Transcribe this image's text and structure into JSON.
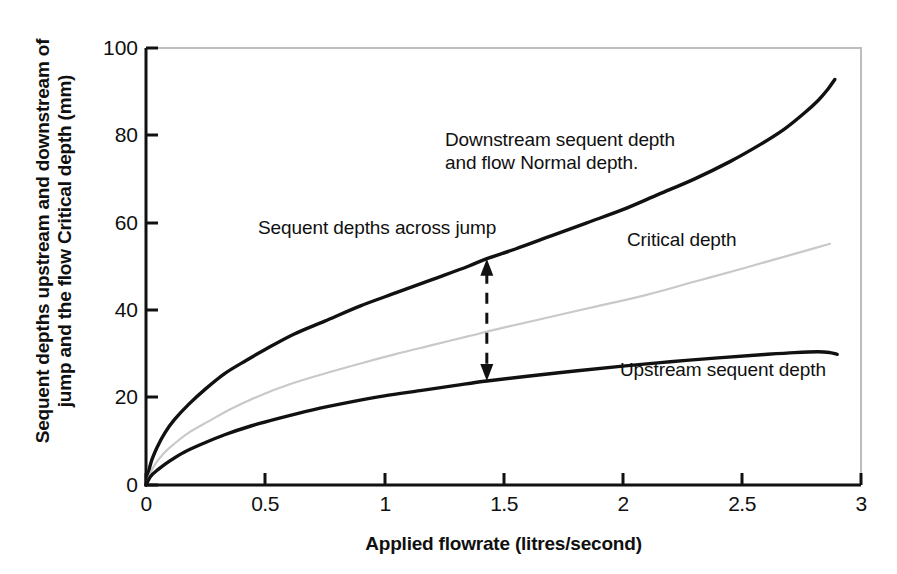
{
  "chart_data": {
    "type": "line",
    "title": "",
    "xlabel": "Applied flowrate (litres/second)",
    "ylabel": "Sequent depths upstream and downstream of\njump and the flow Critical depth (mm)",
    "xlim": [
      0,
      3
    ],
    "ylim": [
      0,
      100
    ],
    "xticks": [
      "0",
      "0.5",
      "1",
      "1.5",
      "2",
      "2.5",
      "3"
    ],
    "xtick_values": [
      0,
      0.5,
      1,
      1.5,
      2,
      2.5,
      3
    ],
    "yticks": [
      "0",
      "20",
      "40",
      "60",
      "80",
      "100"
    ],
    "ytick_values": [
      0,
      20,
      40,
      60,
      80,
      100
    ],
    "grid": false,
    "legend_position": "none",
    "series": [
      {
        "name": "Downstream sequent depth and flow Normal depth",
        "color": "#111111",
        "style": "solid",
        "width": 3.4,
        "points": [
          [
            0.0,
            0.0
          ],
          [
            0.02,
            5.0
          ],
          [
            0.05,
            9.0
          ],
          [
            0.08,
            12.0
          ],
          [
            0.12,
            15.0
          ],
          [
            0.18,
            18.5
          ],
          [
            0.25,
            22.0
          ],
          [
            0.33,
            25.5
          ],
          [
            0.42,
            28.5
          ],
          [
            0.5,
            31.0
          ],
          [
            0.62,
            34.5
          ],
          [
            0.75,
            37.5
          ],
          [
            0.9,
            41.0
          ],
          [
            1.05,
            44.0
          ],
          [
            1.2,
            47.0
          ],
          [
            1.35,
            50.0
          ],
          [
            1.43,
            51.8
          ],
          [
            1.55,
            54.0
          ],
          [
            1.7,
            57.0
          ],
          [
            1.85,
            60.0
          ],
          [
            2.0,
            63.0
          ],
          [
            2.15,
            66.5
          ],
          [
            2.3,
            70.0
          ],
          [
            2.45,
            74.0
          ],
          [
            2.58,
            78.0
          ],
          [
            2.68,
            81.5
          ],
          [
            2.76,
            85.0
          ],
          [
            2.82,
            88.0
          ],
          [
            2.86,
            90.5
          ],
          [
            2.89,
            92.8
          ]
        ]
      },
      {
        "name": "Critical depth",
        "color": "#c9c9c9",
        "style": "solid",
        "width": 2.2,
        "points": [
          [
            0.0,
            0.0
          ],
          [
            0.03,
            4.0
          ],
          [
            0.07,
            7.0
          ],
          [
            0.12,
            9.5
          ],
          [
            0.18,
            12.0
          ],
          [
            0.26,
            14.5
          ],
          [
            0.36,
            17.5
          ],
          [
            0.48,
            20.5
          ],
          [
            0.6,
            23.0
          ],
          [
            0.75,
            25.5
          ],
          [
            0.9,
            27.8
          ],
          [
            1.05,
            30.0
          ],
          [
            1.2,
            32.0
          ],
          [
            1.35,
            34.0
          ],
          [
            1.5,
            36.0
          ],
          [
            1.7,
            38.5
          ],
          [
            1.9,
            41.0
          ],
          [
            2.1,
            43.5
          ],
          [
            2.3,
            46.5
          ],
          [
            2.5,
            49.5
          ],
          [
            2.65,
            51.8
          ],
          [
            2.78,
            53.8
          ],
          [
            2.87,
            55.2
          ]
        ]
      },
      {
        "name": "Upstream sequent depth",
        "color": "#111111",
        "style": "solid",
        "width": 3.4,
        "points": [
          [
            0.0,
            0.0
          ],
          [
            0.02,
            2.0
          ],
          [
            0.05,
            3.5
          ],
          [
            0.1,
            5.5
          ],
          [
            0.16,
            7.5
          ],
          [
            0.24,
            9.5
          ],
          [
            0.33,
            11.5
          ],
          [
            0.44,
            13.5
          ],
          [
            0.56,
            15.3
          ],
          [
            0.7,
            17.2
          ],
          [
            0.85,
            18.9
          ],
          [
            1.0,
            20.4
          ],
          [
            1.15,
            21.6
          ],
          [
            1.3,
            22.8
          ],
          [
            1.43,
            23.8
          ],
          [
            1.6,
            24.9
          ],
          [
            1.8,
            26.1
          ],
          [
            2.0,
            27.2
          ],
          [
            2.2,
            28.2
          ],
          [
            2.4,
            29.1
          ],
          [
            2.58,
            29.8
          ],
          [
            2.72,
            30.3
          ],
          [
            2.82,
            30.5
          ],
          [
            2.87,
            30.3
          ],
          [
            2.9,
            29.9
          ]
        ]
      }
    ],
    "annotations": [
      {
        "name": "downstream-label",
        "text": "Downstream sequent depth\nand flow Normal depth.",
        "x": 1.26,
        "y": 81
      },
      {
        "name": "sequent-depths-label",
        "text": "Sequent depths across jump",
        "x": 0.47,
        "y": 61
      },
      {
        "name": "critical-depth-label",
        "text": "Critical depth",
        "x": 2.02,
        "y": 58
      },
      {
        "name": "upstream-label",
        "text": "Upstream sequent depth",
        "x": 1.99,
        "y": 28
      }
    ],
    "arrow": {
      "name": "sequent-depth-span-arrow",
      "x": 1.43,
      "y_top": 51.8,
      "y_bottom": 23.8,
      "style": "dashed",
      "heads": "both"
    },
    "frame": {
      "axis_color": "#111111",
      "frame_color": "#b9b9b9",
      "background": "#ffffff"
    }
  }
}
